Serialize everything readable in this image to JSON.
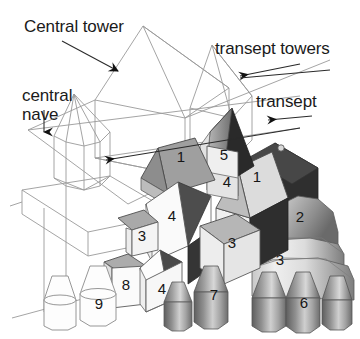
{
  "figure": {
    "kind": "architectural-isometric-diagram",
    "background_color": "#ffffff",
    "ink_color": "#1a1a1a",
    "wireframe_color": "#8e8e8e"
  },
  "callouts": [
    {
      "id": "central-tower",
      "text": "Central tower",
      "x": 24,
      "y": 17,
      "leader": "M 62,41 L 122,73",
      "arrow": "down-right"
    },
    {
      "id": "transept-towers",
      "text": "transept towers",
      "x": 215,
      "y": 39,
      "leader": "M 296,66 L 232,76",
      "arrow": "left"
    },
    {
      "id": "central-nave",
      "text": "central nave",
      "line1": "central",
      "line2": "nave",
      "x": 22,
      "y": 86,
      "leader": "M 44,112 L 44,137",
      "arrow": "down"
    },
    {
      "id": "transept",
      "text": "transept",
      "x": 256,
      "y": 92,
      "leader": "M 300,116 L 262,119",
      "arrow": "left"
    },
    {
      "id": "nave-body-pointer",
      "text": "",
      "leader": "M 300,128 L 100,160",
      "arrow": "left"
    }
  ],
  "block_numbers": [
    {
      "label": "1",
      "x": 181,
      "y": 162,
      "tone": "mid-gray-roof",
      "name": "roof-1-left"
    },
    {
      "label": "5",
      "x": 224,
      "y": 158,
      "tone": "light-tower",
      "name": "tower-5"
    },
    {
      "label": "4",
      "x": 226,
      "y": 180,
      "tone": "light-tower",
      "name": "tower-4-upper"
    },
    {
      "label": "1",
      "x": 256,
      "y": 178,
      "tone": "light-roof",
      "name": "roof-1-right"
    },
    {
      "label": "4",
      "x": 172,
      "y": 219,
      "tone": "white-gable",
      "name": "gable-4"
    },
    {
      "label": "3",
      "x": 141,
      "y": 237,
      "tone": "white-block",
      "name": "block-3-left"
    },
    {
      "label": "2",
      "x": 300,
      "y": 218,
      "tone": "apse-dome",
      "name": "apse-2"
    },
    {
      "label": "3",
      "x": 232,
      "y": 244,
      "tone": "light-block",
      "name": "block-3-center"
    },
    {
      "label": "3",
      "x": 280,
      "y": 262,
      "tone": "apse-drum",
      "name": "apse-3"
    },
    {
      "label": "8",
      "x": 126,
      "y": 286,
      "tone": "white-block",
      "name": "block-8"
    },
    {
      "label": "4",
      "x": 162,
      "y": 290,
      "tone": "white-block",
      "name": "block-4-low"
    },
    {
      "label": "9",
      "x": 99,
      "y": 305,
      "tone": "outline-turret",
      "name": "turret-9"
    },
    {
      "label": "7",
      "x": 215,
      "y": 295,
      "tone": "gray-turret",
      "name": "turret-7"
    },
    {
      "label": "6",
      "x": 304,
      "y": 304,
      "tone": "gray-turret",
      "name": "turret-6"
    }
  ],
  "tones": {
    "white": "#fefefe",
    "near_white": "#f4f4f4",
    "pale": "#e9e9e9",
    "light_gray": "#d6d6d6",
    "mid_light": "#c2c2c2",
    "mid_gray": "#a8a8a8",
    "mid_dark": "#8a8a8a",
    "dark_gray": "#6a6a6a",
    "darker_gray": "#4a4a4a",
    "near_black": "#2b2b2b",
    "black": "#171717",
    "outline": "#6f6f6f",
    "wire": "#9a9a9a"
  }
}
